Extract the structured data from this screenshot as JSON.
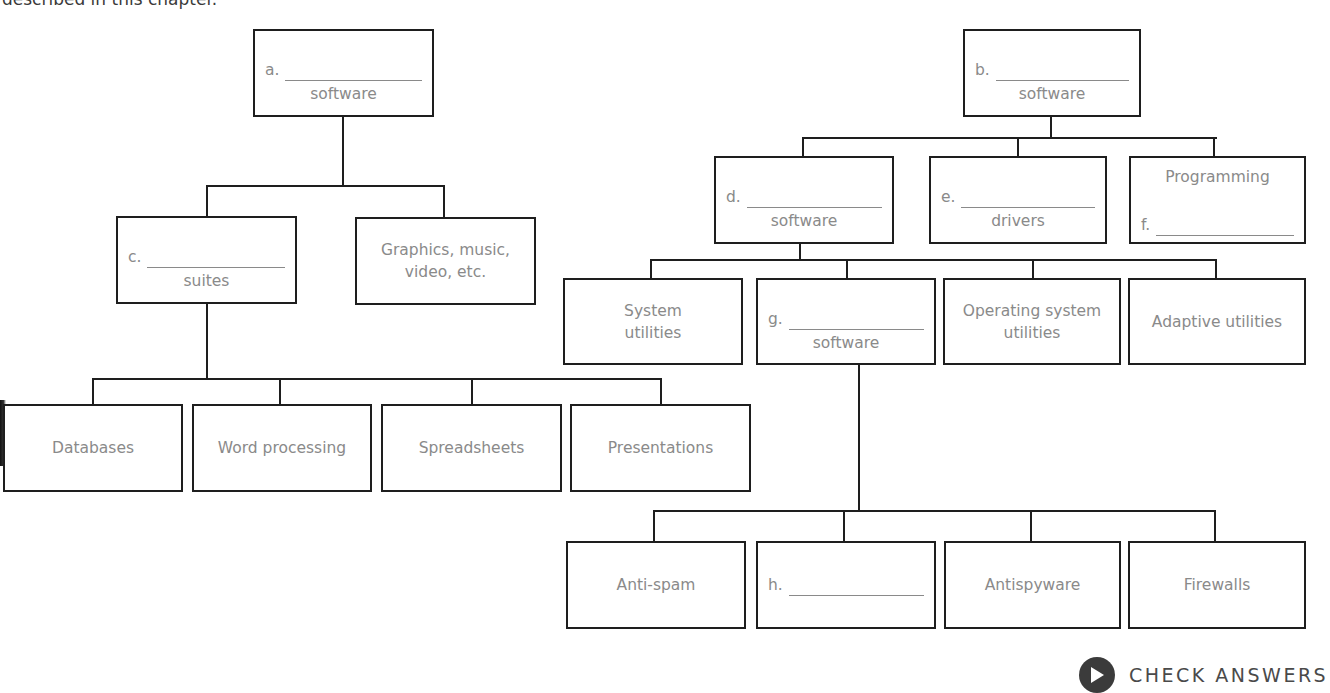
{
  "intro_text": "described in this chapter.",
  "left_tree": {
    "root": {
      "letter": "a.",
      "sub": "software"
    },
    "level1": [
      {
        "letter": "c.",
        "sub": "suites"
      },
      {
        "text_line1": "Graphics, music,",
        "text_line2": "video, etc."
      }
    ],
    "level2": [
      {
        "text": "Databases"
      },
      {
        "text": "Word processing"
      },
      {
        "text": "Spreadsheets"
      },
      {
        "text": "Presentations"
      }
    ]
  },
  "right_tree": {
    "root": {
      "letter": "b.",
      "sub": "software"
    },
    "level1": [
      {
        "letter": "d.",
        "sub": "software"
      },
      {
        "letter": "e.",
        "sub": "drivers"
      },
      {
        "top": "Programming",
        "letter": "f."
      }
    ],
    "level2": [
      {
        "text_line1": "System",
        "text_line2": "utilities"
      },
      {
        "letter": "g.",
        "sub": "software"
      },
      {
        "text_line1": "Operating system",
        "text_line2": "utilities"
      },
      {
        "text": "Adaptive utilities"
      }
    ],
    "level3": [
      {
        "text": "Anti-spam"
      },
      {
        "letter": "h."
      },
      {
        "text": "Antispyware"
      },
      {
        "text": "Firewalls"
      }
    ]
  },
  "check_button": {
    "label": "CHECK ANSWERS",
    "icon": "play-icon",
    "icon_color": "#3b3b3b"
  },
  "colors": {
    "border": "#1e1e1e",
    "text": "#8a8a8a"
  }
}
